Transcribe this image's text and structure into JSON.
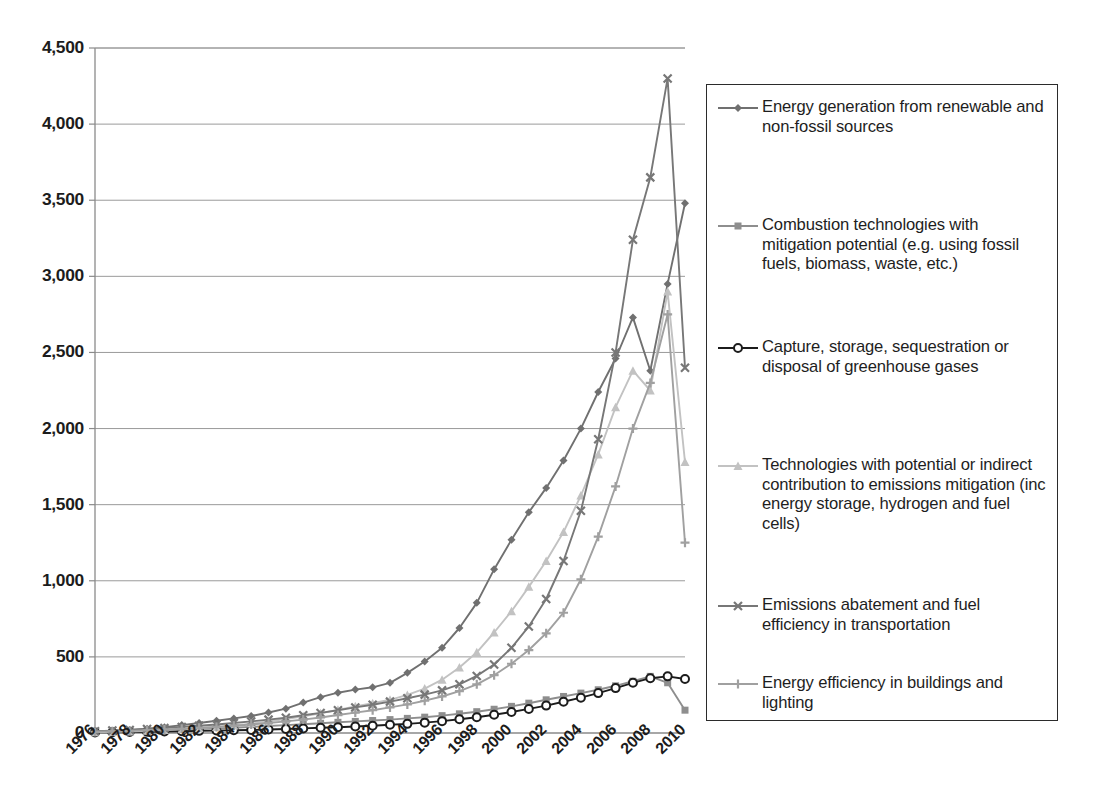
{
  "chart_data": {
    "type": "line",
    "title": "",
    "xlabel": "",
    "ylabel": "",
    "xlim": [
      1976,
      2010
    ],
    "ylim": [
      0,
      4500
    ],
    "ytick_labels": [
      "0",
      "500",
      "1,000",
      "1,500",
      "2,000",
      "2,500",
      "3,000",
      "3,500",
      "4,000",
      "4,500"
    ],
    "ytick_values": [
      0,
      500,
      1000,
      1500,
      2000,
      2500,
      3000,
      3500,
      4000,
      4500
    ],
    "xtick_labels": [
      "1976",
      "1978",
      "1980",
      "1982",
      "1984",
      "1986",
      "1988",
      "1990",
      "1992",
      "1994",
      "1996",
      "1998",
      "2000",
      "2002",
      "2004",
      "2006",
      "2008",
      "2010"
    ],
    "xtick_values": [
      1976,
      1978,
      1980,
      1982,
      1984,
      1986,
      1988,
      1990,
      1992,
      1994,
      1996,
      1998,
      2000,
      2002,
      2004,
      2006,
      2008,
      2010
    ],
    "x": [
      1976,
      1977,
      1978,
      1979,
      1980,
      1981,
      1982,
      1983,
      1984,
      1985,
      1986,
      1987,
      1988,
      1989,
      1990,
      1991,
      1992,
      1993,
      1994,
      1995,
      1996,
      1997,
      1998,
      1999,
      2000,
      2001,
      2002,
      2003,
      2004,
      2005,
      2006,
      2007,
      2008,
      2009,
      2010
    ],
    "grid": "horizontal",
    "legend_position": "right",
    "series": [
      {
        "name": "Energy generation from renewable and non-fossil sources",
        "marker": "diamond",
        "color": "#707070",
        "values": [
          10,
          14,
          20,
          28,
          38,
          52,
          66,
          80,
          96,
          112,
          135,
          160,
          200,
          235,
          265,
          285,
          300,
          330,
          395,
          470,
          560,
          690,
          855,
          1075,
          1270,
          1450,
          1610,
          1790,
          2000,
          2240,
          2460,
          2730,
          2380,
          2950,
          3480
        ]
      },
      {
        "name": "Combustion technologies with mitigation potential (e.g. using fossil fuels, biomass, waste, etc.)",
        "marker": "square",
        "color": "#8e8e8e",
        "values": [
          6,
          8,
          11,
          14,
          18,
          22,
          26,
          30,
          35,
          40,
          46,
          52,
          58,
          64,
          70,
          76,
          82,
          88,
          96,
          104,
          114,
          126,
          140,
          156,
          175,
          196,
          218,
          240,
          262,
          284,
          310,
          340,
          372,
          330,
          150
        ]
      },
      {
        "name": "Capture, storage, sequestration or disposal of greenhouse gases",
        "marker": "circle",
        "color": "#1c1c1c",
        "values": [
          4,
          5,
          6,
          8,
          10,
          12,
          14,
          16,
          18,
          20,
          23,
          26,
          30,
          34,
          38,
          43,
          48,
          54,
          60,
          68,
          78,
          90,
          104,
          120,
          138,
          158,
          180,
          205,
          232,
          262,
          295,
          330,
          360,
          372,
          355
        ]
      },
      {
        "name": "Technologies with potential or indirect contribution to emissions mitigation (inc energy storage, hydrogen and fuel cells)",
        "marker": "triangle",
        "color": "#c2c2c2",
        "values": [
          5,
          7,
          10,
          14,
          19,
          25,
          32,
          40,
          50,
          62,
          76,
          92,
          110,
          130,
          152,
          175,
          196,
          218,
          250,
          292,
          350,
          430,
          530,
          660,
          800,
          960,
          1130,
          1320,
          1560,
          1830,
          2140,
          2380,
          2250,
          2900,
          1780
        ]
      },
      {
        "name": "Emissions abatement and fuel efficiency in transportation",
        "marker": "cross",
        "color": "#777777",
        "values": [
          12,
          16,
          20,
          26,
          32,
          40,
          48,
          56,
          66,
          76,
          88,
          100,
          116,
          132,
          150,
          168,
          186,
          206,
          228,
          252,
          280,
          320,
          375,
          450,
          560,
          700,
          880,
          1130,
          1460,
          1930,
          2500,
          3240,
          3650,
          4300,
          2400
        ]
      },
      {
        "name": "Energy efficiency in buildings and lighting",
        "marker": "plus",
        "color": "#a0a0a0",
        "values": [
          8,
          11,
          14,
          18,
          23,
          28,
          34,
          40,
          48,
          56,
          66,
          76,
          88,
          102,
          118,
          134,
          150,
          168,
          188,
          212,
          240,
          275,
          320,
          380,
          455,
          545,
          655,
          790,
          1010,
          1290,
          1620,
          2000,
          2300,
          2750,
          1250
        ]
      }
    ]
  },
  "legend": {
    "items": [
      {
        "label": "Energy generation from renewable and non-fossil sources",
        "marker": "diamond",
        "color": "#707070"
      },
      {
        "label": "Combustion technologies with mitigation potential (e.g. using fossil fuels, biomass, waste, etc.)",
        "marker": "square",
        "color": "#8e8e8e"
      },
      {
        "label": "Capture, storage, sequestration or disposal of greenhouse gases",
        "marker": "circle",
        "color": "#1c1c1c"
      },
      {
        "label": "Technologies with potential or indirect contribution to emissions mitigation (inc energy storage, hydrogen and fuel cells)",
        "marker": "triangle",
        "color": "#c2c2c2"
      },
      {
        "label": "Emissions abatement and fuel efficiency in transportation",
        "marker": "cross",
        "color": "#777777"
      },
      {
        "label": "Energy efficiency in buildings and lighting",
        "marker": "plus",
        "color": "#a0a0a0"
      }
    ]
  }
}
